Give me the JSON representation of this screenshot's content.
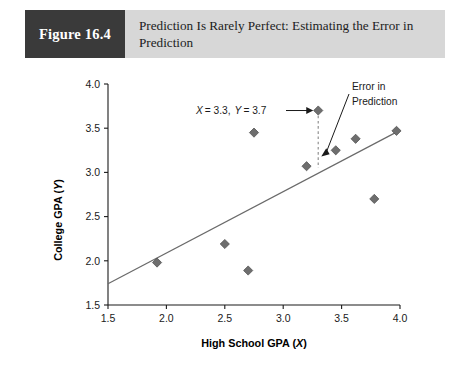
{
  "header": {
    "figure_number": "Figure 16.4",
    "title_line_1": "Prediction Is Rarely Perfect: Estimating the Error in",
    "title_line_2": "Prediction",
    "band_color": "#d7d7d7",
    "number_block_color": "#3a3a3a"
  },
  "chart_data": {
    "type": "scatter",
    "title": "Prediction Is Rarely Perfect: Estimating the Error in Prediction",
    "xlabel": "High School GPA (X)",
    "xlabel_main": "High School GPA (",
    "xlabel_var": "X",
    "xlabel_close": ")",
    "ylabel": "College GPA (Y)",
    "ylabel_main": "College GPA (",
    "ylabel_var": "Y",
    "ylabel_close": ")",
    "xlim": [
      1.5,
      4.0
    ],
    "ylim": [
      1.5,
      4.0
    ],
    "xticks": [
      "1.5",
      "2.0",
      "2.5",
      "3.0",
      "3.5",
      "4.0"
    ],
    "xtick_values": [
      1.5,
      2.0,
      2.5,
      3.0,
      3.5,
      4.0
    ],
    "yticks": [
      "1.5",
      "2.0",
      "2.5",
      "3.0",
      "3.5",
      "4.0"
    ],
    "ytick_values": [
      1.5,
      2.0,
      2.5,
      3.0,
      3.5,
      4.0
    ],
    "grid": false,
    "legend": null,
    "marker_color": "#6e6e6e",
    "marker_shape": "diamond",
    "points": [
      {
        "x": 1.92,
        "y": 1.98
      },
      {
        "x": 2.5,
        "y": 2.19
      },
      {
        "x": 2.7,
        "y": 1.89
      },
      {
        "x": 2.75,
        "y": 3.45
      },
      {
        "x": 3.2,
        "y": 3.07
      },
      {
        "x": 3.3,
        "y": 3.7,
        "highlighted": true
      },
      {
        "x": 3.45,
        "y": 3.25
      },
      {
        "x": 3.62,
        "y": 3.38
      },
      {
        "x": 3.78,
        "y": 2.7
      },
      {
        "x": 3.97,
        "y": 3.47
      }
    ],
    "regression_line": {
      "x_start": 1.5,
      "y_start": 1.74,
      "x_end": 3.99,
      "y_end": 3.47,
      "color": "#6a6a6a"
    },
    "error_segment": {
      "x": 3.3,
      "y_top": 3.7,
      "y_bottom": 3.05,
      "color": "#9a9a9a",
      "style": "dashed"
    },
    "annotations": [
      {
        "name": "point-coordinate-label",
        "text": "X = 3.3, Y = 3.7",
        "part_x_var": "X",
        "part_x_val": "= 3.3,",
        "part_y_var": "Y",
        "part_y_val": "= 3.7",
        "target_x": 3.3,
        "target_y": 3.7
      },
      {
        "name": "error-in-prediction-label",
        "line_1": "Error in",
        "line_2": "Prediction",
        "target_x": 3.3,
        "target_y": 3.18
      }
    ]
  }
}
